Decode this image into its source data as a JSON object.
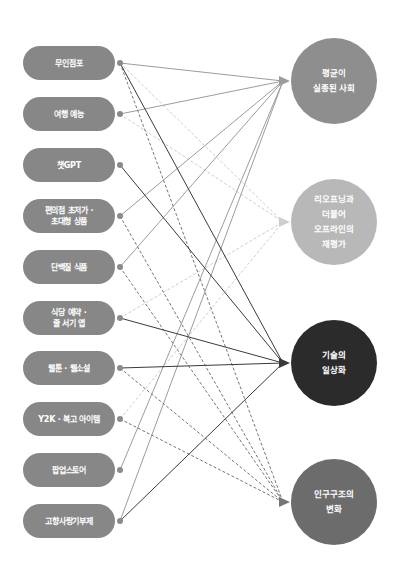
{
  "diagram": {
    "sources": [
      {
        "id": "s0",
        "label": "무인점포",
        "y": 63
      },
      {
        "id": "s1",
        "label": "여행 예능",
        "y": 114
      },
      {
        "id": "s2",
        "label": "챗GPT",
        "y": 165
      },
      {
        "id": "s3",
        "label": "편의점 초저가 ·\n초대형 상품",
        "y": 216
      },
      {
        "id": "s4",
        "label": "단백질 식품",
        "y": 267
      },
      {
        "id": "s5",
        "label": "식당 예약 ·\n줄 서기 앱",
        "y": 318
      },
      {
        "id": "s6",
        "label": "웹툰 · 웹소설",
        "y": 368
      },
      {
        "id": "s7",
        "label": "Y2K · 복고 아이템",
        "y": 419
      },
      {
        "id": "s8",
        "label": "팝업스토어",
        "y": 470
      },
      {
        "id": "s9",
        "label": "고향사랑기부제",
        "y": 521
      }
    ],
    "targets": [
      {
        "id": "A",
        "label": "평균이\n실종된 사회",
        "y": 81,
        "fill": "#8e8e8e",
        "line": "#9c9c9c",
        "dashed": false
      },
      {
        "id": "B",
        "label": "리오프닝과\n더불어\n오프라인의\n재평가",
        "y": 222,
        "fill": "#b8b8b8",
        "line": "#cdcdcd",
        "dashed": true
      },
      {
        "id": "C",
        "label": "기술의\n일상화",
        "y": 363,
        "fill": "#2b2b2b",
        "line": "#3a3a3a",
        "dashed": false
      },
      {
        "id": "D",
        "label": "인구구조의\n변화",
        "y": 502,
        "fill": "#6c6c6c",
        "line": "#767676",
        "dashed": true
      }
    ],
    "edges": [
      [
        "s0",
        "A"
      ],
      [
        "s0",
        "B"
      ],
      [
        "s0",
        "C"
      ],
      [
        "s0",
        "D"
      ],
      [
        "s1",
        "A"
      ],
      [
        "s1",
        "B"
      ],
      [
        "s2",
        "C"
      ],
      [
        "s3",
        "A"
      ],
      [
        "s3",
        "D"
      ],
      [
        "s4",
        "A"
      ],
      [
        "s4",
        "D"
      ],
      [
        "s5",
        "B"
      ],
      [
        "s5",
        "C"
      ],
      [
        "s6",
        "C"
      ],
      [
        "s6",
        "D"
      ],
      [
        "s7",
        "B"
      ],
      [
        "s7",
        "D"
      ],
      [
        "s8",
        "A"
      ],
      [
        "s9",
        "A"
      ],
      [
        "s9",
        "C"
      ]
    ]
  }
}
